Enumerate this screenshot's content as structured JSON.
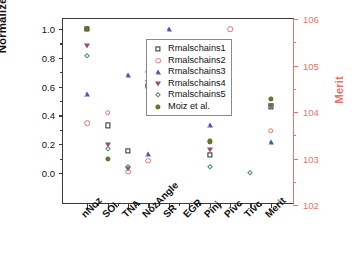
{
  "axes": {
    "y_left": {
      "label": "Normalized values",
      "ticks": [
        "0.0",
        "0.2",
        "0.4",
        "0.6",
        "0.8",
        "1.0"
      ],
      "min": 0.0,
      "max": 1.0,
      "color": "#111111"
    },
    "y_right": {
      "label": "Merit",
      "ticks": [
        "102",
        "103",
        "104",
        "105",
        "106"
      ],
      "min": 102,
      "max": 106,
      "color": "#E8736A"
    },
    "x": {
      "categories": [
        "nNoz",
        "SOI",
        "TNA",
        "NozAngle",
        "SR",
        "EGR",
        "Pinj",
        "Pivc",
        "Tivc",
        "Merit"
      ]
    }
  },
  "legend": {
    "position": "top-center",
    "entries": [
      {
        "label": "Rmalschains1",
        "marker": "open-square",
        "color": "#2b2b2b"
      },
      {
        "label": "Rmalschains2",
        "marker": "open-circle",
        "color": "#E8736A"
      },
      {
        "label": "Rmalschains3",
        "marker": "open-triangle-up",
        "color": "#4a5ab0"
      },
      {
        "label": "Rmalschains4",
        "marker": "open-triangle-down",
        "color": "#9c4a7a"
      },
      {
        "label": "Rmalschains5",
        "marker": "open-diamond",
        "color": "#3f8f52"
      },
      {
        "label": "Moiz et al.",
        "marker": "filled-circle",
        "color": "#6b7a22"
      }
    ]
  },
  "chart_data": {
    "type": "scatter",
    "title": "",
    "xlabel": "",
    "ylabel": "Normalized values",
    "ylabel_secondary": "Merit",
    "ylim": [
      0.0,
      1.0
    ],
    "ylim_secondary": [
      102,
      106
    ],
    "grid": false,
    "legend_position": "top-center",
    "categories": [
      "nNoz",
      "SOI",
      "TNA",
      "NozAngle",
      "SR",
      "EGR",
      "Pinj",
      "Pivc",
      "Tivc",
      "Merit"
    ],
    "note": "Merit category values are read on the secondary (right) axis in Merit units; all other categories are read on the left normalized axis.",
    "series": [
      {
        "name": "Rmalschains1",
        "marker": "open-square",
        "color": "#2b2b2b",
        "values": [
          1.0,
          0.33,
          0.155,
          0.605,
          0.425,
          0.615,
          0.125,
          null,
          null,
          null
        ],
        "merit": 104.12
      },
      {
        "name": "Rmalschains2",
        "marker": "open-circle",
        "color": "#E8736A",
        "values": [
          0.345,
          0.42,
          0.01,
          0.085,
          null,
          0.47,
          0.905,
          1.0,
          null,
          null
        ],
        "merit": 103.6
      },
      {
        "name": "Rmalschains3",
        "marker": "open-triangle-up",
        "color": "#4a5ab0",
        "values": [
          0.55,
          null,
          0.68,
          0.135,
          1.0,
          0.51,
          0.335,
          null,
          null,
          null
        ],
        "merit": 103.35
      },
      {
        "name": "Rmalschains4",
        "marker": "open-triangle-down",
        "color": "#9c4a7a",
        "values": [
          0.885,
          0.195,
          0.03,
          0.625,
          0.43,
          0.625,
          0.16,
          null,
          null,
          null
        ],
        "merit": 104.13
      },
      {
        "name": "Rmalschains5",
        "marker": "open-diamond",
        "color": "#3f8f52",
        "values": [
          0.81,
          0.17,
          0.045,
          0.64,
          0.425,
          0.6,
          0.045,
          null,
          0.0,
          null
        ],
        "merit": 104.12
      },
      {
        "name": "Moiz et al.",
        "marker": "filled-circle",
        "color": "#6b7a22",
        "values": [
          1.0,
          0.1,
          null,
          0.7,
          null,
          0.68,
          0.22,
          null,
          null,
          null
        ],
        "merit": 104.28
      }
    ]
  }
}
